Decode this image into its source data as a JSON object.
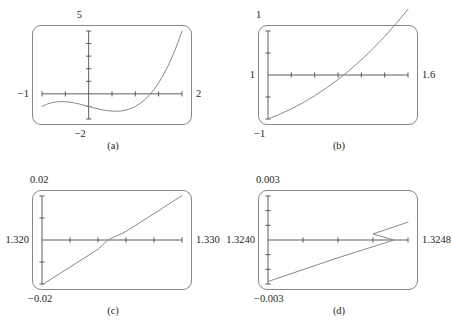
{
  "figure": {
    "background_color": "#ffffff",
    "frame_color": "#868686",
    "curve_color": "#8a8a8a",
    "axis_color": "#4d4d4d",
    "text_color": "#231f20"
  },
  "panels": [
    {
      "id": "a",
      "caption": "(a)",
      "label_top": "5",
      "label_bottom": "−2",
      "label_left": "−1",
      "label_right": "2",
      "chart_data": {
        "type": "line",
        "title": "",
        "xlabel": "",
        "ylabel": "",
        "xlim": [
          -1,
          2
        ],
        "ylim": [
          -2,
          5
        ],
        "grid": false,
        "legend": null,
        "x_ticks": [
          -1,
          -0.5,
          0,
          0.5,
          1,
          1.5,
          2
        ],
        "y_ticks": [
          -2,
          -1,
          0,
          1,
          2,
          3,
          4,
          5
        ],
        "x_tick_labels": [
          "−1",
          "",
          "",
          "",
          "",
          "",
          "2"
        ],
        "y_tick_labels": [
          "−2",
          "",
          "",
          "",
          "",
          "",
          "",
          "5"
        ],
        "series": [
          {
            "name": "f(x)",
            "x": [
              -1.0,
              -0.9,
              -0.8,
              -0.7,
              -0.6,
              -0.5,
              -0.4,
              -0.3,
              -0.2,
              -0.1,
              0.0,
              0.1,
              0.2,
              0.3,
              0.4,
              0.5,
              0.6,
              0.7,
              0.8,
              0.9,
              1.0,
              1.1,
              1.2,
              1.3,
              1.4,
              1.5,
              1.6,
              1.7,
              1.8,
              1.9,
              2.0
            ],
            "y": [
              -1.0,
              -0.829,
              -0.712,
              -0.643,
              -0.616,
              -0.625,
              -0.664,
              -0.727,
              -0.808,
              -0.901,
              -1.0,
              -1.099,
              -1.192,
              -1.273,
              -1.336,
              -1.375,
              -1.384,
              -1.357,
              -1.288,
              -1.171,
              -1.0,
              -0.769,
              -0.472,
              -0.103,
              0.344,
              0.875,
              1.496,
              2.213,
              3.032,
              3.959,
              5.0
            ]
          }
        ]
      }
    },
    {
      "id": "b",
      "caption": "(b)",
      "label_top": "1",
      "label_bottom": "−1",
      "label_left": "1",
      "label_right": "1.6",
      "chart_data": {
        "type": "line",
        "title": "",
        "xlabel": "",
        "ylabel": "",
        "xlim": [
          1,
          1.6
        ],
        "ylim": [
          -1,
          1
        ],
        "grid": false,
        "legend": null,
        "x_ticks": [
          1.0,
          1.1,
          1.2,
          1.3,
          1.4,
          1.5,
          1.6
        ],
        "y_ticks": [
          -1,
          -0.5,
          0,
          0.5,
          1
        ],
        "x_tick_labels": [
          "1",
          "",
          "",
          "",
          "",
          "",
          "1.6"
        ],
        "y_tick_labels": [
          "−1",
          "",
          "",
          "",
          "1"
        ],
        "series": [
          {
            "name": "f(x)",
            "x": [
              1.0,
              1.05,
              1.1,
              1.15,
              1.2,
              1.25,
              1.3,
              1.3247,
              1.35,
              1.4,
              1.45,
              1.5,
              1.55,
              1.6
            ],
            "y": [
              -1.0,
              -0.892,
              -0.769,
              -0.629,
              -0.472,
              -0.297,
              -0.103,
              0.0,
              0.111,
              0.344,
              0.599,
              0.875,
              1.174,
              1.496
            ]
          }
        ]
      }
    },
    {
      "id": "c",
      "caption": "(c)",
      "label_top": "0.02",
      "label_bottom": "−0.02",
      "label_left": "1.320",
      "label_right": "1.330",
      "chart_data": {
        "type": "line",
        "title": "",
        "xlabel": "",
        "ylabel": "",
        "xlim": [
          1.32,
          1.33
        ],
        "ylim": [
          -0.02,
          0.02
        ],
        "grid": false,
        "legend": null,
        "x_ticks": [
          1.32,
          1.322,
          1.324,
          1.326,
          1.328,
          1.33
        ],
        "y_ticks": [
          -0.02,
          -0.01,
          0,
          0.01,
          0.02
        ],
        "x_tick_labels": [
          "1.320",
          "",
          "",
          "",
          "",
          "1.330"
        ],
        "y_tick_labels": [
          "−0.02",
          "",
          "",
          "",
          "0.02"
        ],
        "series": [
          {
            "name": "f(x)",
            "x": [
              1.32,
              1.322,
              1.324,
              1.3247,
              1.326,
              1.328,
              1.33
            ],
            "y": [
              -0.0204,
              -0.0123,
              -0.0042,
              0.0,
              0.0039,
              0.012,
              0.0202
            ]
          }
        ]
      }
    },
    {
      "id": "d",
      "caption": "(d)",
      "label_top": "0.003",
      "label_bottom": "−0.003",
      "label_left": "1.3240",
      "label_right": "1.3248",
      "chart_data": {
        "type": "line",
        "title": "",
        "xlabel": "",
        "ylabel": "",
        "xlim": [
          1.324,
          1.3248
        ],
        "ylim": [
          -0.003,
          0.003
        ],
        "grid": false,
        "legend": null,
        "x_ticks": [
          1.324,
          1.3242,
          1.3244,
          1.3246,
          1.3248
        ],
        "y_ticks": [
          -0.003,
          -0.002,
          -0.001,
          0,
          0.001,
          0.002,
          0.003
        ],
        "x_tick_labels": [
          "1.3240",
          "",
          "",
          "",
          "1.3248"
        ],
        "y_tick_labels": [
          "−0.003",
          "",
          "",
          "",
          "",
          "",
          "0.003"
        ],
        "series": [
          {
            "name": "f(x)",
            "x": [
              1.324,
              1.3242,
              1.3244,
              1.32472,
              1.3246,
              1.3248
            ],
            "y": [
              -0.00283,
              -0.00202,
              -0.00121,
              0.0,
              0.00041,
              0.00122
            ]
          }
        ]
      }
    }
  ]
}
